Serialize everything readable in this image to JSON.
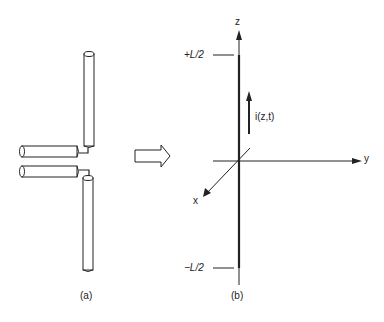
{
  "figure": {
    "panel_a": {
      "caption": "(a)"
    },
    "panel_b": {
      "caption": "(b)",
      "axes": {
        "z_label": "z",
        "y_label": "y",
        "x_label": "x"
      },
      "top_marker": "+L/2",
      "bottom_marker": "−L/2",
      "current_label": "i(z,t)"
    },
    "transition_arrow": "hollow-right-arrow",
    "colors": {
      "ink": "#222222",
      "background": "#ffffff"
    }
  }
}
